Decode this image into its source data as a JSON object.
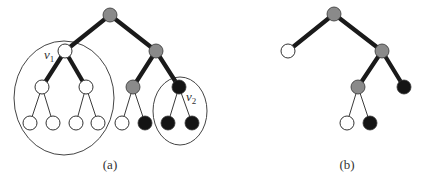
{
  "figure": {
    "colors": {
      "white": "#ffffff",
      "gray": "#8a8a8a",
      "black": "#141414",
      "stroke": "#333333"
    },
    "panel_a": {
      "caption": "(a)",
      "labels": {
        "v1": {
          "base": "v",
          "sub": "1"
        },
        "v2": {
          "base": "v",
          "sub": "2"
        }
      },
      "nodes": [
        {
          "id": "root",
          "x": 110,
          "y": 15,
          "fill": "gray"
        },
        {
          "id": "v1",
          "x": 65,
          "y": 51,
          "fill": "white"
        },
        {
          "id": "r1",
          "x": 156,
          "y": 51,
          "fill": "gray"
        },
        {
          "id": "l1",
          "x": 42,
          "y": 87,
          "fill": "white"
        },
        {
          "id": "l2",
          "x": 86,
          "y": 87,
          "fill": "white"
        },
        {
          "id": "g1",
          "x": 133,
          "y": 87,
          "fill": "gray"
        },
        {
          "id": "v2",
          "x": 179,
          "y": 87,
          "fill": "black"
        },
        {
          "id": "a",
          "x": 30,
          "y": 123,
          "fill": "white"
        },
        {
          "id": "b",
          "x": 53,
          "y": 123,
          "fill": "white"
        },
        {
          "id": "c",
          "x": 76,
          "y": 123,
          "fill": "white"
        },
        {
          "id": "d",
          "x": 98,
          "y": 123,
          "fill": "white"
        },
        {
          "id": "e",
          "x": 122,
          "y": 123,
          "fill": "white"
        },
        {
          "id": "f",
          "x": 145,
          "y": 123,
          "fill": "black"
        },
        {
          "id": "g",
          "x": 168,
          "y": 123,
          "fill": "black"
        },
        {
          "id": "h",
          "x": 192,
          "y": 123,
          "fill": "black"
        }
      ],
      "edges": [
        {
          "from": "root",
          "to": "v1",
          "weight": "thick"
        },
        {
          "from": "root",
          "to": "r1",
          "weight": "thick"
        },
        {
          "from": "v1",
          "to": "l1",
          "weight": "thick"
        },
        {
          "from": "v1",
          "to": "l2",
          "weight": "thick"
        },
        {
          "from": "r1",
          "to": "g1",
          "weight": "thick"
        },
        {
          "from": "r1",
          "to": "v2",
          "weight": "thick"
        },
        {
          "from": "l1",
          "to": "a",
          "weight": "thin"
        },
        {
          "from": "l1",
          "to": "b",
          "weight": "thin"
        },
        {
          "from": "l2",
          "to": "c",
          "weight": "thin"
        },
        {
          "from": "l2",
          "to": "d",
          "weight": "thin"
        },
        {
          "from": "g1",
          "to": "e",
          "weight": "thin"
        },
        {
          "from": "g1",
          "to": "f",
          "weight": "thin"
        },
        {
          "from": "v2",
          "to": "g",
          "weight": "thin"
        },
        {
          "from": "v2",
          "to": "h",
          "weight": "thin"
        }
      ],
      "enclosures": [
        {
          "name": "subtree-v1",
          "cx": 64,
          "cy": 98,
          "rx": 50,
          "ry": 57
        },
        {
          "name": "subtree-v2",
          "cx": 180,
          "cy": 111,
          "rx": 27,
          "ry": 34
        }
      ]
    },
    "panel_b": {
      "caption": "(b)",
      "nodes": [
        {
          "id": "root",
          "x": 334,
          "y": 14,
          "fill": "gray"
        },
        {
          "id": "w",
          "x": 288,
          "y": 51,
          "fill": "white"
        },
        {
          "id": "r1",
          "x": 382,
          "y": 51,
          "fill": "gray"
        },
        {
          "id": "g1",
          "x": 358,
          "y": 87,
          "fill": "gray"
        },
        {
          "id": "k",
          "x": 404,
          "y": 87,
          "fill": "black"
        },
        {
          "id": "e",
          "x": 347,
          "y": 123,
          "fill": "white"
        },
        {
          "id": "f",
          "x": 370,
          "y": 123,
          "fill": "black"
        }
      ],
      "edges": [
        {
          "from": "root",
          "to": "w",
          "weight": "thick"
        },
        {
          "from": "root",
          "to": "r1",
          "weight": "thick"
        },
        {
          "from": "r1",
          "to": "g1",
          "weight": "thick"
        },
        {
          "from": "r1",
          "to": "k",
          "weight": "thick"
        },
        {
          "from": "g1",
          "to": "e",
          "weight": "thin"
        },
        {
          "from": "g1",
          "to": "f",
          "weight": "thin"
        }
      ]
    }
  }
}
